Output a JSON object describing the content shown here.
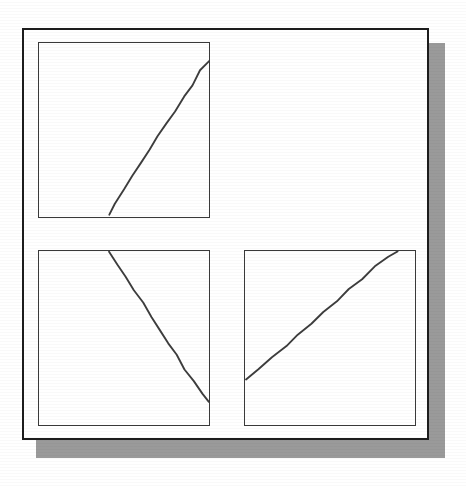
{
  "figure": {
    "background_color": "#ffffff",
    "frame_border_color": "#1d1d1d",
    "shadow_color": "#9a9a9a",
    "panel_border_color": "#3a3a3a",
    "line_color": "#3d3d3d",
    "panel_count": 3,
    "layout": "2x2 grid with the top-right cell empty"
  },
  "chart_data": [
    {
      "id": "panel-top-left",
      "type": "line",
      "title": "",
      "subtitle": "",
      "xlabel": "",
      "ylabel": "",
      "grid": false,
      "legend": null,
      "xlim": [
        0,
        100
      ],
      "ylim": [
        0,
        100
      ],
      "axis_ticks": {
        "x": [],
        "y": []
      },
      "annotations": [],
      "series": [
        {
          "name": "ascending-trend",
          "description": "Nearly straight line rising from lower-middle of the panel to the upper-right corner region",
          "x": [
            41,
            45,
            50,
            55,
            60,
            65,
            70,
            75,
            80,
            85,
            90,
            95,
            100
          ],
          "y": [
            1,
            8,
            16,
            24,
            31,
            39,
            46,
            54,
            61,
            69,
            76,
            84,
            90
          ]
        }
      ]
    },
    {
      "id": "panel-bottom-left",
      "type": "line",
      "title": "",
      "subtitle": "",
      "xlabel": "",
      "ylabel": "",
      "grid": false,
      "legend": null,
      "xlim": [
        0,
        100
      ],
      "ylim": [
        0,
        100
      ],
      "axis_ticks": {
        "x": [],
        "y": []
      },
      "annotations": [],
      "series": [
        {
          "name": "descending-trend",
          "description": "Nearly straight line falling from the top edge at mid-left to the right edge at lower-right",
          "x": [
            41,
            46,
            51,
            56,
            61,
            66,
            71,
            76,
            81,
            86,
            91,
            96,
            100
          ],
          "y": [
            100,
            92,
            85,
            77,
            70,
            62,
            55,
            47,
            40,
            32,
            25,
            18,
            13
          ]
        }
      ]
    },
    {
      "id": "panel-bottom-right",
      "type": "line",
      "title": "",
      "subtitle": "",
      "xlabel": "",
      "ylabel": "",
      "grid": false,
      "legend": null,
      "xlim": [
        0,
        100
      ],
      "ylim": [
        0,
        100
      ],
      "axis_ticks": {
        "x": [],
        "y": []
      },
      "annotations": [],
      "series": [
        {
          "name": "ascending-trend",
          "description": "Nearly straight line rising from the left edge at lower-left to the top edge at right of centre",
          "x": [
            1,
            8,
            16,
            24,
            31,
            39,
            46,
            54,
            61,
            69,
            76,
            84,
            90
          ],
          "y": [
            26,
            32,
            39,
            45,
            52,
            58,
            65,
            71,
            78,
            84,
            91,
            97,
            100
          ]
        }
      ]
    }
  ]
}
